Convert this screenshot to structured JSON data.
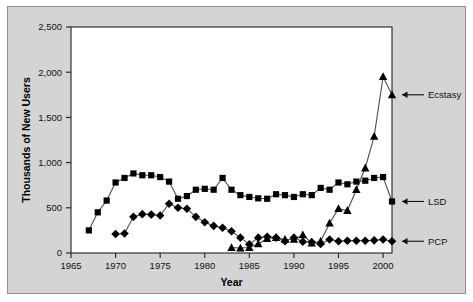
{
  "chart_data": {
    "type": "line",
    "title": "",
    "xlabel": "Year",
    "ylabel": "Thousands of New Users",
    "xlim": [
      1965,
      2001
    ],
    "ylim": [
      0,
      2500
    ],
    "xticks": [
      1965,
      1970,
      1975,
      1980,
      1985,
      1990,
      1995,
      2000
    ],
    "xtick_labels": [
      "1965",
      "1970",
      "1975",
      "1980",
      "1985",
      "1990",
      "1995",
      "2000"
    ],
    "yticks": [
      0,
      500,
      1000,
      1500,
      2000,
      2500
    ],
    "ytick_labels": [
      "0",
      "500",
      "1,000",
      "1,500",
      "2,000",
      "2,500"
    ],
    "grid": false,
    "legend_position": "right-edge-annotations",
    "series": [
      {
        "name": "LSD",
        "marker": "square",
        "label": "LSD",
        "x": [
          1967,
          1968,
          1969,
          1970,
          1971,
          1972,
          1973,
          1974,
          1975,
          1976,
          1977,
          1978,
          1979,
          1980,
          1981,
          1982,
          1983,
          1984,
          1985,
          1986,
          1987,
          1988,
          1989,
          1990,
          1991,
          1992,
          1993,
          1994,
          1995,
          1996,
          1997,
          1998,
          1999,
          2000,
          2001
        ],
        "values": [
          250,
          450,
          580,
          780,
          830,
          880,
          860,
          860,
          840,
          790,
          600,
          630,
          700,
          710,
          700,
          830,
          700,
          640,
          620,
          605,
          600,
          650,
          640,
          620,
          650,
          640,
          720,
          700,
          780,
          760,
          790,
          800,
          830,
          840,
          570
        ]
      },
      {
        "name": "PCP",
        "marker": "diamond",
        "label": "PCP",
        "x": [
          1970,
          1971,
          1972,
          1973,
          1974,
          1975,
          1976,
          1977,
          1978,
          1979,
          1980,
          1981,
          1982,
          1983,
          1984,
          1985,
          1986,
          1987,
          1988,
          1989,
          1990,
          1991,
          1992,
          1993,
          1994,
          1995,
          1996,
          1997,
          1998,
          1999,
          2000,
          2001
        ],
        "values": [
          210,
          215,
          400,
          430,
          425,
          415,
          545,
          500,
          490,
          400,
          340,
          300,
          280,
          240,
          170,
          95,
          170,
          180,
          170,
          130,
          170,
          125,
          120,
          100,
          150,
          130,
          135,
          135,
          135,
          140,
          150,
          130
        ]
      },
      {
        "name": "Ecstasy",
        "marker": "triangle",
        "label": "Ecstasy",
        "x": [
          1983,
          1984,
          1985,
          1986,
          1987,
          1988,
          1989,
          1990,
          1991,
          1992,
          1993,
          1994,
          1995,
          1996,
          1997,
          1998,
          1999,
          2000,
          2001
        ],
        "values": [
          60,
          55,
          60,
          100,
          160,
          170,
          150,
          150,
          200,
          110,
          130,
          330,
          490,
          470,
          700,
          940,
          1290,
          1950,
          1750
        ]
      }
    ],
    "annotations": [
      {
        "name": "ecstasy-label",
        "text": "Ecstasy",
        "series": "Ecstasy",
        "at_year": 2001
      },
      {
        "name": "lsd-label",
        "text": "LSD",
        "series": "LSD",
        "at_year": 2001
      },
      {
        "name": "pcp-label",
        "text": "PCP",
        "series": "PCP",
        "at_year": 2001
      }
    ],
    "colors": {
      "series_line": "#4d4d4d",
      "marker": "#000000",
      "panel_background": "#d4d4d4",
      "plot_background": "#ffffff",
      "axis": "#222222",
      "text": "#111111"
    }
  }
}
